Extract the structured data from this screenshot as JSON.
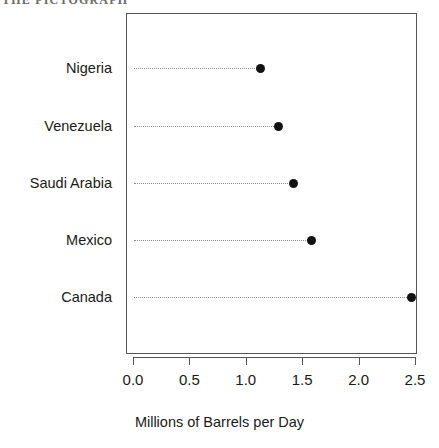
{
  "page": {
    "header_fragment": "THE PICTOGRAPH",
    "background_color": "#ffffff"
  },
  "chart_data": {
    "type": "scatter",
    "subtype": "cleveland-dot-plot",
    "orientation": "horizontal",
    "title": "",
    "xlabel": "Millions of Barrels per Day",
    "ylabel": "",
    "categories": [
      "Nigeria",
      "Venezuela",
      "Saudi Arabia",
      "Mexico",
      "Canada"
    ],
    "values": [
      1.13,
      1.29,
      1.42,
      1.58,
      2.47
    ],
    "xlim": [
      0.0,
      2.5
    ],
    "xticks": [
      0.0,
      0.5,
      1.0,
      1.5,
      2.0,
      2.5
    ],
    "xticklabels": [
      "0.0",
      "0.5",
      "1.0",
      "1.5",
      "2.0",
      "2.5"
    ],
    "grid": false,
    "leader_lines": "dotted",
    "legend": null,
    "marker": {
      "shape": "circle",
      "filled": true,
      "color": "#121212",
      "size_px": 9
    },
    "frame_color": "#555555",
    "points": [
      {
        "category": "Nigeria",
        "value": 1.13,
        "row": 0
      },
      {
        "category": "Venezuela",
        "value": 1.29,
        "row": 1
      },
      {
        "category": "Saudi Arabia",
        "value": 1.42,
        "row": 2
      },
      {
        "category": "Mexico",
        "value": 1.58,
        "row": 3
      },
      {
        "category": "Canada",
        "value": 2.47,
        "row": 4
      }
    ]
  }
}
